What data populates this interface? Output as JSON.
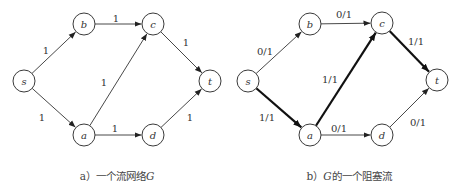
{
  "figures": [
    {
      "id": "a",
      "caption_prefix": "a）一个流网络",
      "caption_var": "G",
      "caption_suffix": "",
      "caption_x": 117,
      "nodes": [
        {
          "id": "s",
          "label": "s",
          "x": 24,
          "y": 81
        },
        {
          "id": "b",
          "label": "b",
          "x": 84,
          "y": 24
        },
        {
          "id": "c",
          "label": "c",
          "x": 153,
          "y": 24
        },
        {
          "id": "a",
          "label": "a",
          "x": 84,
          "y": 135
        },
        {
          "id": "d",
          "label": "d",
          "x": 153,
          "y": 135
        },
        {
          "id": "t",
          "label": "t",
          "x": 210,
          "y": 81
        }
      ],
      "edges": [
        {
          "from": "s",
          "to": "b",
          "label": "1",
          "thick": false,
          "lx": 46,
          "ly": 50
        },
        {
          "from": "s",
          "to": "a",
          "label": "1",
          "thick": false,
          "lx": 42,
          "ly": 117
        },
        {
          "from": "b",
          "to": "c",
          "label": "1",
          "thick": false,
          "lx": 116,
          "ly": 18
        },
        {
          "from": "a",
          "to": "c",
          "label": "1",
          "thick": false,
          "lx": 104,
          "ly": 82
        },
        {
          "from": "a",
          "to": "d",
          "label": "1",
          "thick": false,
          "lx": 115,
          "ly": 128
        },
        {
          "from": "c",
          "to": "t",
          "label": "1",
          "thick": false,
          "lx": 186,
          "ly": 42
        },
        {
          "from": "d",
          "to": "t",
          "label": "1",
          "thick": false,
          "lx": 190,
          "ly": 117
        }
      ]
    },
    {
      "id": "b",
      "caption_prefix": "b）",
      "caption_var": "G",
      "caption_suffix": "的一个阻塞流",
      "caption_x": 349,
      "nodes": [
        {
          "id": "s",
          "label": "s",
          "x": 248,
          "y": 81
        },
        {
          "id": "b",
          "label": "b",
          "x": 310,
          "y": 24
        },
        {
          "id": "c",
          "label": "c",
          "x": 382,
          "y": 23
        },
        {
          "id": "a",
          "label": "a",
          "x": 310,
          "y": 135
        },
        {
          "id": "d",
          "label": "d",
          "x": 382,
          "y": 135
        },
        {
          "id": "t",
          "label": "t",
          "x": 437,
          "y": 80
        }
      ],
      "edges": [
        {
          "from": "s",
          "to": "b",
          "label": "0/1",
          "thick": false,
          "lx": 265,
          "ly": 51
        },
        {
          "from": "s",
          "to": "a",
          "label": "1/1",
          "thick": true,
          "lx": 267,
          "ly": 117
        },
        {
          "from": "b",
          "to": "c",
          "label": "0/1",
          "thick": false,
          "lx": 344,
          "ly": 14
        },
        {
          "from": "a",
          "to": "c",
          "label": "1/1",
          "thick": true,
          "lx": 330,
          "ly": 79
        },
        {
          "from": "a",
          "to": "d",
          "label": "0/1",
          "thick": false,
          "lx": 339,
          "ly": 128
        },
        {
          "from": "c",
          "to": "t",
          "label": "1/1",
          "thick": true,
          "lx": 416,
          "ly": 41
        },
        {
          "from": "d",
          "to": "t",
          "label": "0/1",
          "thick": false,
          "lx": 418,
          "ly": 122
        }
      ]
    }
  ],
  "style": {
    "node_radius": 11,
    "stroke_color": "#333333",
    "thick_color": "#111111"
  }
}
